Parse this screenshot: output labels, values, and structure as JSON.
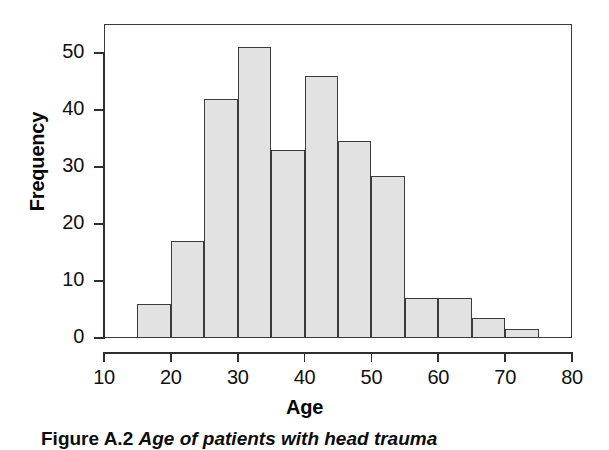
{
  "figure": {
    "caption_label": "Figure A.2",
    "caption_text": "Age of patients with head trauma"
  },
  "chart_data": {
    "type": "bar",
    "title": "",
    "xlabel": "Age",
    "ylabel": "Frequency",
    "xlim": [
      10,
      80
    ],
    "ylim": [
      0,
      53
    ],
    "xticks": [
      10,
      20,
      30,
      40,
      50,
      60,
      70,
      80
    ],
    "yticks": [
      0,
      10,
      20,
      30,
      40,
      50
    ],
    "grid": false,
    "legend": "none",
    "bin_width": 5,
    "bin_edges": [
      15,
      20,
      25,
      30,
      35,
      40,
      45,
      50,
      55,
      60,
      65,
      70,
      75
    ],
    "categories": [
      "15-20",
      "20-25",
      "25-30",
      "30-35",
      "35-40",
      "40-45",
      "45-50",
      "50-55",
      "55-60",
      "60-65",
      "65-70",
      "70-75"
    ],
    "values": [
      6,
      17,
      42,
      51,
      33,
      46,
      34.5,
      28.5,
      7,
      7,
      3.5,
      1.5
    ],
    "bar_fill": "#e2e2e2",
    "bar_border": "#3b3b3b",
    "axis_color": "#2f2f2f"
  }
}
